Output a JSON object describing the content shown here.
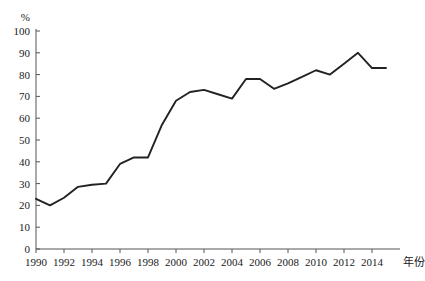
{
  "chart_data": {
    "type": "line",
    "title": "",
    "subtitle": "",
    "xlabel": "年份",
    "ylabel": "%",
    "x": [
      1990,
      1991,
      1992,
      1993,
      1994,
      1995,
      1996,
      1997,
      1998,
      1999,
      2000,
      2001,
      2002,
      2003,
      2004,
      2005,
      2006,
      2007,
      2008,
      2009,
      2010,
      2011,
      2012,
      2013,
      2014,
      2015
    ],
    "values": [
      23,
      20,
      23.5,
      28.5,
      29.5,
      30,
      39,
      42,
      42,
      57,
      68,
      72,
      73,
      71,
      69,
      78,
      78,
      73.5,
      76,
      79,
      82,
      80,
      85,
      90,
      83,
      83
    ],
    "series": [
      {
        "name": "",
        "values": [
          23,
          20,
          23.5,
          28.5,
          29.5,
          30,
          39,
          42,
          42,
          57,
          68,
          72,
          73,
          71,
          69,
          78,
          78,
          73.5,
          76,
          79,
          82,
          80,
          85,
          90,
          83,
          83
        ]
      }
    ],
    "xlim": [
      1990,
      2015
    ],
    "ylim": [
      0,
      100
    ],
    "y_ticks": [
      0,
      10,
      20,
      30,
      40,
      50,
      60,
      70,
      80,
      90,
      100
    ],
    "y_tick_labels": [
      "0",
      "10",
      "20",
      "30",
      "40",
      "50",
      "60",
      "70",
      "80",
      "90",
      "100"
    ],
    "x_ticks": [
      1990,
      1992,
      1994,
      1996,
      1998,
      2000,
      2002,
      2004,
      2006,
      2008,
      2010,
      2012,
      2014
    ],
    "x_tick_labels": [
      "1990",
      "1992",
      "1994",
      "1996",
      "1998",
      "2000",
      "2002",
      "2004",
      "2006",
      "2008",
      "2010",
      "2012",
      "2014"
    ],
    "grid": false,
    "legend": false,
    "legend_position": "none",
    "line_color": "#222222",
    "axis_color": "#555555",
    "background_color": "#ffffff"
  }
}
